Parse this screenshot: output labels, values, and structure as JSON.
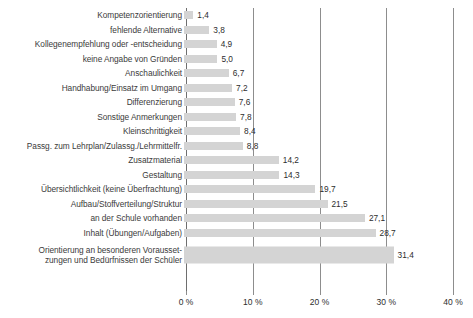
{
  "chart_data": {
    "type": "bar",
    "orientation": "horizontal",
    "title": "",
    "subtitle": "",
    "xlabel": "",
    "ylabel": "",
    "xlim": [
      0,
      40
    ],
    "grid": true,
    "legend": false,
    "value_suffix": "%",
    "decimal_separator": ",",
    "bar_color": "#d4d4d4",
    "gridline_color": "#8d8d8d",
    "text_color": "#2d2d2d",
    "background": "#ffffff",
    "xticks": [
      0,
      10,
      20,
      30,
      40
    ],
    "xtick_labels": [
      "0 %",
      "10 %",
      "20 %",
      "30 %",
      "40 %"
    ],
    "categories": [
      "Kompetenzorientierung",
      "fehlende Alternative",
      "Kollegenempfehlung oder -entscheidung",
      "keine Angabe von Gründen",
      "Anschaulichkeit",
      "Handhabung/Einsatz im Umgang",
      "Differenzierung",
      "Sonstige Anmerkungen",
      "Kleinschrittigkeit",
      "Passg. zum Lehrplan/Zulassg./Lehrmittelfr.",
      "Zusatzmaterial",
      "Gestaltung",
      "Übersichtlichkeit (keine Überfrachtung)",
      "Aufbau/Stoffverteilung/Struktur",
      "an der Schule vorhanden",
      "Inhalt (Übungen/Aufgaben)",
      "Orientierung an besonderen Vorausset-\nzungen und Bedürfnissen der Schüler"
    ],
    "values": [
      1.4,
      3.8,
      4.9,
      5.0,
      6.7,
      7.2,
      7.6,
      7.8,
      8.4,
      8.8,
      14.2,
      14.3,
      19.7,
      21.5,
      27.1,
      28.7,
      31.4
    ],
    "value_labels": [
      "1,4",
      "3,8",
      "4,9",
      "5,0",
      "6,7",
      "7,2",
      "7,6",
      "7,8",
      "8,4",
      "8,8",
      "14,2",
      "14,3",
      "19,7",
      "21,5",
      "27,1",
      "28,7",
      "31,4"
    ],
    "tall_rows": [
      16
    ]
  }
}
